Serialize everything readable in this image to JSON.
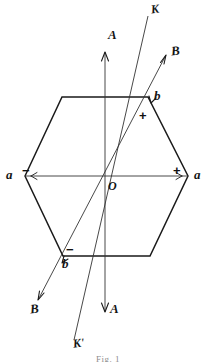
{
  "figure": {
    "caption": "Fig. 1",
    "background_color": "#ffffff",
    "ink_color": "#1a1a1a"
  },
  "shape": {
    "name": "hexagon",
    "vertices": [
      {
        "id": "a-left",
        "x": 25,
        "y": 176
      },
      {
        "id": "b-upper-left",
        "x": 62,
        "y": 97
      },
      {
        "id": "b-upper-right",
        "x": 148,
        "y": 97
      },
      {
        "id": "a-right",
        "x": 188,
        "y": 176
      },
      {
        "id": "b-lower-right",
        "x": 150,
        "y": 256
      },
      {
        "id": "b-lower-left",
        "x": 63,
        "y": 256
      }
    ]
  },
  "axes": {
    "A": {
      "label": "A",
      "top_label": "A",
      "bottom_label": "A",
      "x1": 105,
      "y1": 52,
      "x2": 105,
      "y2": 312,
      "arrow_top": true,
      "arrow_bottom": true
    },
    "B": {
      "label": "B",
      "top_label": "B",
      "bottom_label": "B",
      "x1": 38,
      "y1": 300,
      "x2": 166,
      "y2": 55,
      "arrow_top": true,
      "arrow_bottom": true
    },
    "K": {
      "label": "K",
      "top_label": "K",
      "bottom_label": "K'",
      "x1": 74,
      "y1": 340,
      "x2": 148,
      "y2": 16,
      "arrow_top": false,
      "arrow_bottom": false
    },
    "a_a": {
      "label": "a",
      "left_label": "a",
      "right_label": "a",
      "x1": 25,
      "y1": 176,
      "x2": 188,
      "y2": 176
    }
  },
  "labels": {
    "origin": "O",
    "axis_a_top": "A",
    "axis_a_bottom": "A",
    "axis_b_top": "B",
    "axis_b_bottom": "B",
    "axis_k_top": "K",
    "axis_k_bottom": "K'",
    "vertex_a_left": "a",
    "vertex_a_right": "a",
    "vertex_b_upper_right": "b",
    "vertex_b_lower_left": "b"
  },
  "signs": {
    "left_minus": "−",
    "right_plus": "+",
    "upper_right_plus": "+",
    "lower_left_minus": "−"
  }
}
